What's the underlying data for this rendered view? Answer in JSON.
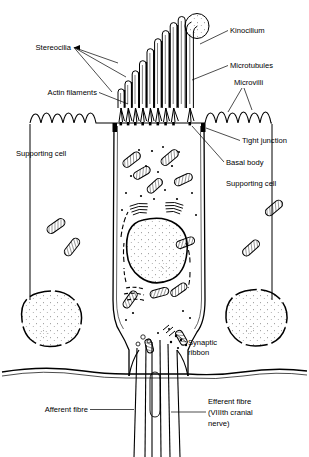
{
  "figure": {
    "type": "biological-cross-section",
    "background_color": "#ffffff",
    "ink_color": "#000000"
  },
  "labels": {
    "stereocilia": "Stereocilia",
    "kinocilium": "Kinocilium",
    "microtubules": "Microtubules",
    "microvilli": "Microvilli",
    "actin_filaments": "Actin filaments",
    "tight_junction": "Tight junction",
    "basal_body": "Basal body",
    "supporting_cell_left": "Supporting cell",
    "supporting_cell_right": "Supporting cell",
    "synaptic_ribbon_line1": "Synaptic",
    "synaptic_ribbon_line2": "ribbon",
    "afferent_fibre": "Afferent fibre",
    "efferent_fibre_line1": "Efferent fibre",
    "efferent_fibre_line2": "(VIIIth cranial",
    "efferent_fibre_line3": "nerve)"
  },
  "structures": {
    "stereocilia_count": 9,
    "stereocilia_arrangement": "graduated staircase, shortest at left, tallest at right",
    "kinocilium_tip": "bulbous stippled knob",
    "microvilli_description": "wavy looped projections on supporting cell apical surface",
    "mitochondria_description": "elongated cross-hatched ovals",
    "nucleus_description": "large round stippled nucleus with nucleolus",
    "supporting_cell_nuclei": 2,
    "basement_membrane": "horizontal wavy line across lower third",
    "nerve_fibres": "bundle descending below basement membrane"
  }
}
